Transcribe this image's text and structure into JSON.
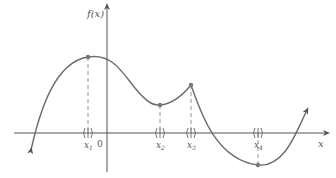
{
  "figure": {
    "y_axis_label": "f(x)",
    "x_axis_label": "x",
    "origin_label": "0",
    "points": [
      {
        "label": "x₁",
        "sub": "1",
        "kind": "local maximum"
      },
      {
        "label": "x₂",
        "sub": "2",
        "kind": "local minimum"
      },
      {
        "label": "x₃",
        "sub": "3",
        "kind": "local maximum (corner)"
      },
      {
        "label": "x₄",
        "sub": "4",
        "kind": "absolute minimum"
      }
    ],
    "interval_marker": "( | )",
    "colors": {
      "curve": "#6b6b6b",
      "axes": "#555555",
      "dashed": "#8a8a8a",
      "text": "#555555"
    }
  }
}
